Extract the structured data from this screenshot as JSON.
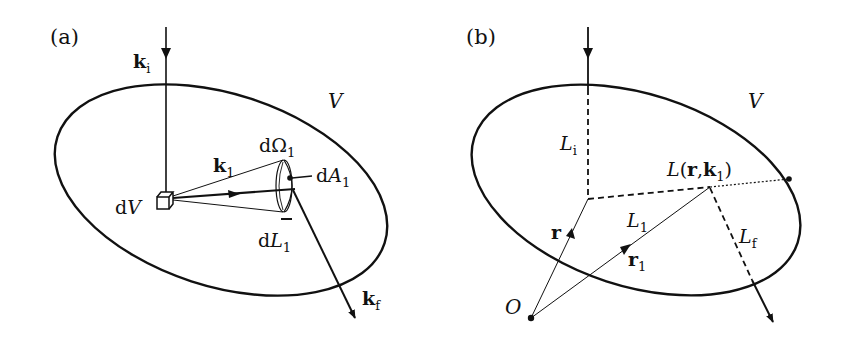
{
  "panels": [
    {
      "id": "a",
      "label": "(a)",
      "region": "V",
      "labels": {
        "k_i": {
          "main": "k",
          "sub": "i"
        },
        "k_1": {
          "main": "k",
          "sub": "1"
        },
        "k_f": {
          "main": "k",
          "sub": "f"
        },
        "dV": {
          "prefix": "d",
          "main": "V"
        },
        "dOmega1": {
          "prefix": "d",
          "main": "Ω",
          "sub": "1"
        },
        "dA1": {
          "prefix": "d",
          "main": "A",
          "sub": "1"
        },
        "dL1": {
          "prefix": "d",
          "main": "L",
          "sub": "1"
        }
      }
    },
    {
      "id": "b",
      "label": "(b)",
      "region": "V",
      "labels": {
        "L_i": {
          "main": "L",
          "sub": "i"
        },
        "L_1": {
          "main": "L",
          "sub": "1"
        },
        "L_f": {
          "main": "L",
          "sub": "f"
        },
        "L_r_k1": {
          "main": "L",
          "open": "(",
          "r": "r",
          "comma": ",",
          "k": "k",
          "sub": "1",
          "close": ")"
        },
        "r": {
          "main": "r"
        },
        "r_1": {
          "main": "r",
          "sub": "1"
        },
        "origin": {
          "main": "O"
        }
      }
    }
  ],
  "colors": {
    "stroke": "#111111",
    "background": "#ffffff"
  }
}
